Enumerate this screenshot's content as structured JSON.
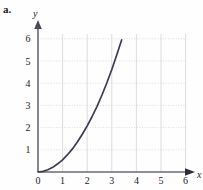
{
  "figure": {
    "part_label": "a."
  },
  "chart_data": {
    "type": "line",
    "title": "",
    "subtitle": "",
    "xlabel": "x",
    "ylabel": "y",
    "xlim": [
      0,
      6.6
    ],
    "ylim": [
      0,
      6.4
    ],
    "xticks": [
      0,
      1,
      2,
      3,
      4,
      5,
      6
    ],
    "xticklabels": [
      "0",
      "1",
      "2",
      "3",
      "4",
      "5",
      "6"
    ],
    "yticks": [
      1,
      2,
      3,
      4,
      5,
      6
    ],
    "yticklabels": [
      "1",
      "2",
      "3",
      "4",
      "5",
      "6"
    ],
    "grid": true,
    "grid_style": "dotted horizontal, light vertical",
    "legend": "none",
    "curve_color": "#3c3c50",
    "axis_color": "#555566",
    "grid_color": "#d8d8de",
    "series": [
      {
        "name": "curve",
        "description": "increasing concave-up curve from origin",
        "x": [
          0.0,
          0.2,
          0.4,
          0.6,
          0.8,
          1.0,
          1.2,
          1.4,
          1.6,
          1.8,
          2.0,
          2.2,
          2.4,
          2.6,
          2.8,
          3.0,
          3.2,
          3.4
        ],
        "y": [
          0.0,
          0.03,
          0.1,
          0.21,
          0.37,
          0.55,
          0.78,
          1.04,
          1.35,
          1.7,
          2.08,
          2.5,
          2.96,
          3.47,
          4.02,
          4.62,
          5.27,
          5.95
        ]
      }
    ]
  }
}
